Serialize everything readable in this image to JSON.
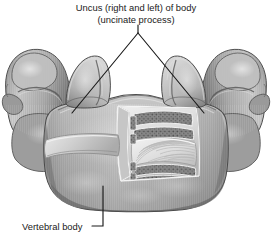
{
  "figure": {
    "kind": "anatomical-illustration",
    "background_color": "#ffffff",
    "ink_color": "#1a1a1a"
  },
  "labels": {
    "uncus": {
      "line1": "Uncus (right and left) of body",
      "line2": "(uncinate process)"
    },
    "vertebral_body": "Vertebral body"
  },
  "leaders": {
    "uncus_apex": {
      "x": 138,
      "y": 33
    },
    "uncus_left_end": {
      "x": 72,
      "y": 113
    },
    "uncus_right_end": {
      "x": 204,
      "y": 113
    },
    "vertebral_body_elbow": {
      "x": 103,
      "y": 226
    },
    "vertebral_body_end": {
      "x": 103,
      "y": 186
    }
  },
  "palette": {
    "bone_light": "#d2d2d2",
    "bone_mid": "#a8a8a8",
    "bone_dark": "#7c7c7c",
    "bone_shadow": "#5a5a5a",
    "bone_deep": "#454545",
    "cortical": "#e6e6e6",
    "trabecular": "#6e6e6e"
  }
}
